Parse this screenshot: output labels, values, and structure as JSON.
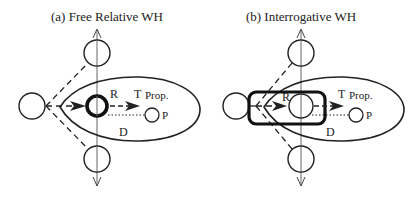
{
  "panels": [
    {
      "title": "(a) Free Relative WH",
      "labels": {
        "r": "R",
        "t": "T",
        "prop": "Prop.",
        "p": "P",
        "d": "D"
      }
    },
    {
      "title": "(b) Interrogative WH",
      "labels": {
        "r": "R",
        "t": "T",
        "prop": "Prop.",
        "p": "P",
        "d": "D"
      }
    }
  ],
  "colors": {
    "stroke": "#222222",
    "axis": "#555555",
    "background": "#ffffff"
  }
}
